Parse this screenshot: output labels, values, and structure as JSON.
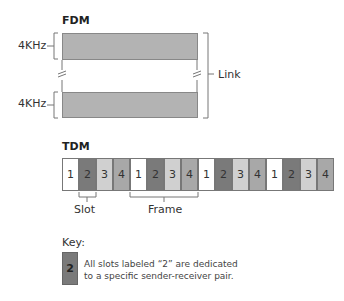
{
  "fdm": {
    "title": "FDM",
    "channel_label_top": "4KHz",
    "channel_label_bottom": "4KHz",
    "link_label": "Link",
    "band_color": "#b3b3b3"
  },
  "tdm": {
    "title": "TDM",
    "slots": [
      "1",
      "2",
      "3",
      "4",
      "1",
      "2",
      "3",
      "4",
      "1",
      "2",
      "3",
      "4",
      "1",
      "2",
      "3",
      "4"
    ],
    "slot_colors": {
      "1": "#ffffff",
      "2": "#7a7a7a",
      "3": "#d0d0d0",
      "4": "#a8a8a8"
    },
    "slot_label": "Slot",
    "frame_label": "Frame"
  },
  "key": {
    "title": "Key:",
    "swatch_label": "2",
    "line1": "All slots labeled “2” are dedicated",
    "line2": "to a specific sender-receiver pair."
  }
}
